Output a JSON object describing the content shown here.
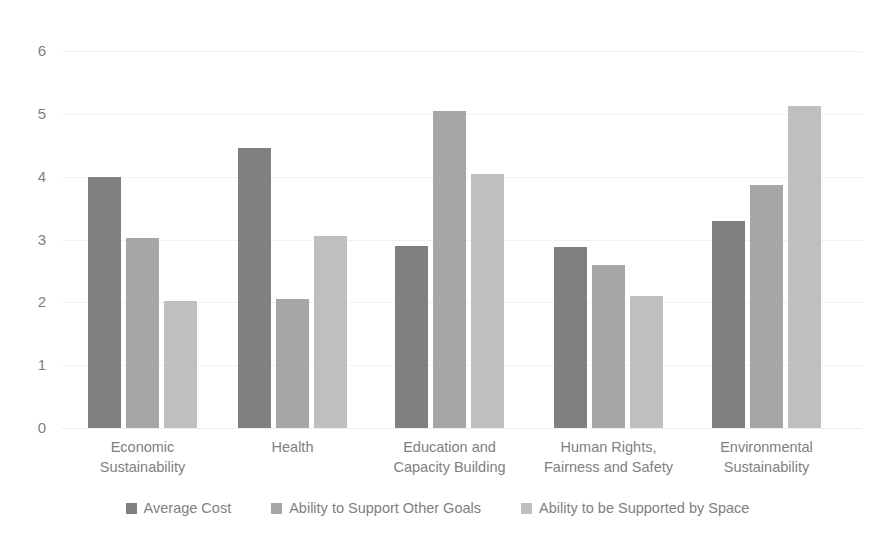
{
  "chart_data": {
    "type": "bar",
    "title": "",
    "xlabel": "",
    "ylabel": "",
    "ylim": [
      0,
      6
    ],
    "yticks": [
      6,
      5,
      4,
      3,
      2,
      1,
      0
    ],
    "grid": true,
    "legend_position": "bottom",
    "categories": [
      "Economic\nSustainability",
      "Health",
      "Education and\nCapacity Building",
      "Human Rights,\nFairness and Safety",
      "Environmental\nSustainability"
    ],
    "series": [
      {
        "name": "Average Cost",
        "color": "#808080",
        "values": [
          4.0,
          4.45,
          2.9,
          2.88,
          3.3
        ]
      },
      {
        "name": "Ability to Support Other Goals",
        "color": "#a6a6a6",
        "values": [
          3.02,
          2.05,
          5.05,
          2.6,
          3.87
        ]
      },
      {
        "name": "Ability to be Supported by Space",
        "color": "#bfbfbf",
        "values": [
          2.02,
          3.05,
          4.05,
          2.1,
          5.12
        ]
      }
    ]
  },
  "axis": {
    "tick_labels": [
      "6",
      "5",
      "4",
      "3",
      "2",
      "1",
      "0"
    ]
  },
  "legend": {
    "items": [
      {
        "label": "Average Cost",
        "color": "#808080"
      },
      {
        "label": "Ability to Support Other Goals",
        "color": "#a6a6a6"
      },
      {
        "label": "Ability to be Supported by Space",
        "color": "#bfbfbf"
      }
    ]
  },
  "title_sliver": {
    "text": ""
  }
}
